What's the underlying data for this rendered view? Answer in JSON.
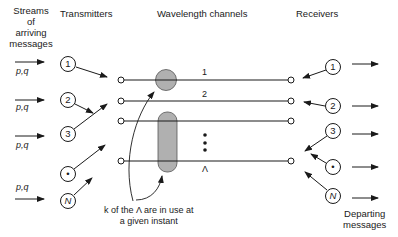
{
  "headers": {
    "streams": [
      "Streams",
      "of",
      "arriving",
      "messages"
    ],
    "transmitters": "Transmitters",
    "channels": "Wavelength channels",
    "receivers": "Receivers"
  },
  "inputs": [
    {
      "label": "p,q"
    },
    {
      "label": "p,q"
    },
    {
      "label": "p,q"
    },
    {
      "label": "p,q"
    }
  ],
  "transmitters": [
    "1",
    "2",
    "3",
    "•",
    "N"
  ],
  "receivers": [
    "1",
    "2",
    "3",
    "•",
    "N"
  ],
  "channels": {
    "labels": [
      "1",
      "2",
      "",
      "Λ"
    ],
    "ellipsis": "⋮"
  },
  "annotation": [
    "k of the Λ are in use at",
    "a given instant"
  ],
  "departing": [
    "Departing",
    "messages"
  ],
  "colors": {
    "ink": "#1a1a1a",
    "busy_fill": "#b0b0b0",
    "background": "#ffffff"
  }
}
